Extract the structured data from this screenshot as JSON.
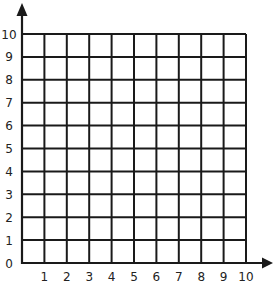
{
  "diagram": {
    "type": "coordinate-grid",
    "x_axis": {
      "ticks": [
        "1",
        "2",
        "3",
        "4",
        "5",
        "6",
        "7",
        "8",
        "9",
        "10"
      ],
      "origin_label": "0"
    },
    "y_axis": {
      "ticks": [
        "0",
        "1",
        "2",
        "3",
        "4",
        "5",
        "6",
        "7",
        "8",
        "9",
        "10"
      ]
    },
    "grid": {
      "columns": 10,
      "rows": 10
    },
    "colors": {
      "line": "#1a1a1a",
      "background": "#ffffff",
      "text": "#222222"
    }
  }
}
